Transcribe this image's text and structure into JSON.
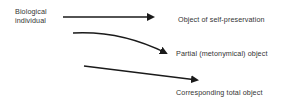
{
  "diagram": {
    "source": {
      "label_line1": "Biological",
      "label_line2": "individual"
    },
    "targets": [
      {
        "label": "Object of self-preservation"
      },
      {
        "label": "Partial (metonymical) object"
      },
      {
        "label": "Corresponding total object"
      }
    ],
    "arrow_color": "#1a1a1a",
    "text_color": "#333333"
  }
}
